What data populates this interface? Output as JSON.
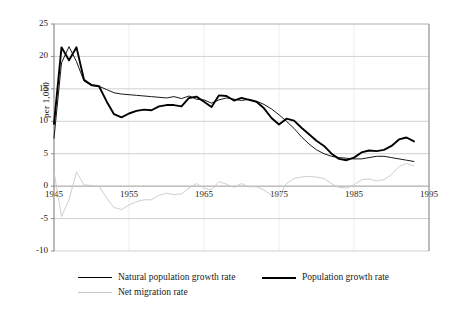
{
  "chart_data": {
    "type": "line",
    "title": "",
    "xlabel": "",
    "ylabel": "per 1,000",
    "xlim": [
      1945,
      1995
    ],
    "ylim": [
      -10,
      25
    ],
    "grid": true,
    "legend_position": "bottom",
    "xticks": [
      "1945",
      "1955",
      "1965",
      "1975",
      "1985",
      "1995"
    ],
    "xtick_values": [
      1945,
      1955,
      1965,
      1975,
      1985,
      1995
    ],
    "yticks": [
      "25",
      "20",
      "15",
      "10",
      "5",
      "0",
      "-5",
      "-10"
    ],
    "ytick_values": [
      25,
      20,
      15,
      10,
      5,
      0,
      -5,
      -10
    ],
    "x": [
      1945,
      1946,
      1947,
      1948,
      1949,
      1950,
      1951,
      1952,
      1953,
      1954,
      1955,
      1956,
      1957,
      1958,
      1959,
      1960,
      1961,
      1962,
      1963,
      1964,
      1965,
      1966,
      1967,
      1968,
      1969,
      1970,
      1971,
      1972,
      1973,
      1974,
      1975,
      1976,
      1977,
      1978,
      1979,
      1980,
      1981,
      1982,
      1983,
      1984,
      1985,
      1986,
      1987,
      1988,
      1989,
      1990,
      1991,
      1992,
      1993
    ],
    "series": [
      {
        "name": "Natural population growth rate",
        "color": "#000000",
        "width": 0.9,
        "values": [
          7.4,
          19.0,
          21.5,
          19.2,
          16.2,
          15.5,
          15.4,
          14.9,
          14.4,
          14.2,
          14.1,
          14.0,
          13.9,
          13.8,
          13.7,
          13.6,
          13.8,
          13.5,
          13.9,
          13.4,
          13.3,
          12.8,
          13.3,
          13.6,
          13.4,
          13.2,
          13.4,
          13.1,
          12.6,
          11.9,
          11.0,
          10.0,
          8.9,
          7.6,
          6.5,
          5.6,
          5.0,
          4.6,
          4.4,
          4.3,
          4.2,
          4.2,
          4.4,
          4.6,
          4.6,
          4.4,
          4.2,
          4.0,
          3.8
        ]
      },
      {
        "name": "Population growth rate",
        "color": "#000000",
        "width": 1.9,
        "values": [
          9.6,
          21.4,
          19.4,
          21.4,
          16.4,
          15.6,
          15.4,
          13.1,
          11.1,
          10.6,
          11.2,
          11.6,
          11.8,
          11.7,
          12.3,
          12.5,
          12.5,
          12.3,
          13.6,
          13.8,
          13.0,
          12.2,
          14.0,
          13.9,
          13.2,
          13.6,
          13.3,
          13.0,
          12.0,
          10.5,
          9.5,
          10.4,
          10.1,
          9.0,
          8.0,
          7.0,
          6.2,
          5.0,
          4.2,
          4.0,
          4.4,
          5.2,
          5.5,
          5.4,
          5.6,
          6.2,
          7.2,
          7.5,
          6.9
        ]
      },
      {
        "name": "Net migration rate",
        "color": "#c8c8c8",
        "width": 0.9,
        "values": [
          2.2,
          -4.7,
          -2.1,
          2.2,
          0.2,
          0.1,
          0.0,
          -1.8,
          -3.3,
          -3.6,
          -2.9,
          -2.4,
          -2.1,
          -2.1,
          -1.4,
          -1.1,
          -1.3,
          -1.2,
          -0.3,
          0.4,
          -0.3,
          -0.6,
          0.7,
          0.3,
          -0.2,
          0.4,
          -0.1,
          -0.1,
          -0.6,
          -1.4,
          -1.5,
          0.4,
          1.2,
          1.4,
          1.5,
          1.4,
          1.2,
          0.4,
          -0.2,
          -0.3,
          0.2,
          1.0,
          1.1,
          0.8,
          1.0,
          1.8,
          3.0,
          3.5,
          3.1
        ]
      }
    ]
  },
  "legend": {
    "items": [
      {
        "label": "Natural population growth rate",
        "color": "#000000",
        "width": 1.0
      },
      {
        "label": "Population growth rate",
        "color": "#000000",
        "width": 2.2
      },
      {
        "label": "Net migration rate",
        "color": "#c8c8c8",
        "width": 1.0
      }
    ]
  }
}
